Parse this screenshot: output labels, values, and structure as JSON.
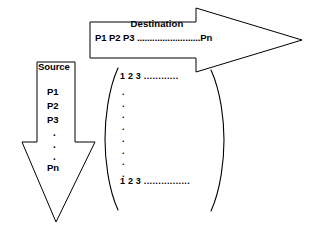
{
  "diagram": {
    "background_color": "#ffffff",
    "stroke_color": "#000000",
    "text_color": "#000000"
  },
  "destination_arrow": {
    "name": "destination-arrow",
    "direction": "right",
    "title": "Destination",
    "ports_line": "P1 P2 P3 .........................Pn",
    "ports": [
      "P1",
      "P2",
      "P3",
      "Pn"
    ]
  },
  "source_arrow": {
    "name": "source-arrow",
    "direction": "down",
    "title": "Source",
    "ports": [
      "P1",
      "P2",
      "P3",
      "Pn"
    ],
    "vertical_ellipsis": ".",
    "items": [
      {
        "label": "P1"
      },
      {
        "label": "P2"
      },
      {
        "label": "P3"
      },
      {
        "label": "Pn"
      }
    ]
  },
  "matrix": {
    "name": "port-matrix",
    "left_bracket": "(",
    "right_bracket": ")",
    "top_row": "1  2  3",
    "top_row_trailing": "............",
    "bottom_row": "1  2  3",
    "bottom_row_trailing": "................",
    "row_values": [
      "1",
      "2",
      "3"
    ],
    "vertical_dot": ".",
    "vertical_dot_count": 8
  }
}
